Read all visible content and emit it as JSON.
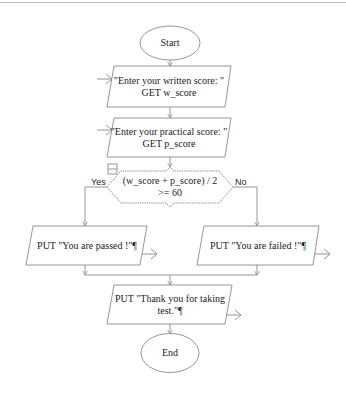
{
  "diagram": {
    "type": "flowchart",
    "colors": {
      "stroke": "#8a8a8a",
      "text": "#222222",
      "background": "#ffffff"
    },
    "nodes": {
      "start": {
        "shape": "oval",
        "label": "Start"
      },
      "input_written": {
        "shape": "parallelogram",
        "line1": "\"Enter your written score: \"",
        "line2": "GET w_score"
      },
      "input_practical": {
        "shape": "parallelogram",
        "line1": "\"Enter your practical score: \"",
        "line2": "GET p_score"
      },
      "decision": {
        "shape": "hexagon",
        "line1": "(w_score + p_score) / 2",
        "line2": ">= 60"
      },
      "output_passed": {
        "shape": "parallelogram",
        "label": "PUT \"You are passed !\"¶"
      },
      "output_failed": {
        "shape": "parallelogram",
        "label": "PUT \"You are failed !\"¶"
      },
      "output_thanks": {
        "shape": "parallelogram",
        "line1": "PUT \"Thank you for taking",
        "line2": "test.\"¶"
      },
      "end": {
        "shape": "oval",
        "label": "End"
      }
    },
    "edges": {
      "yes_label": "Yes",
      "no_label": "No"
    }
  }
}
